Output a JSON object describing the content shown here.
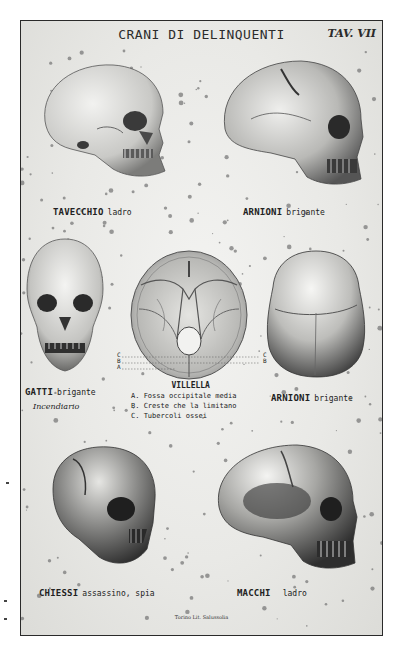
{
  "plate": {
    "title": "CRANI DI DELINQUENTI",
    "plate_number": "TAV. VII",
    "printer": "Torino Lit. Salussolia"
  },
  "figures": [
    {
      "id": "tavecchio",
      "name": "TAVECCHIO",
      "desc": "ladro",
      "view": "lateral-left"
    },
    {
      "id": "arnioni-lateral",
      "name": "ARNIONI",
      "desc": "brigante",
      "view": "lateral-right"
    },
    {
      "id": "gatti",
      "name": "GATTI",
      "desc": "brigante",
      "desc2": "Incendiario",
      "view": "frontal"
    },
    {
      "id": "villella",
      "name": "VILLELLA",
      "view": "cranial-base"
    },
    {
      "id": "arnioni-top",
      "name": "ARNIONI",
      "desc": "brigante",
      "view": "superior"
    },
    {
      "id": "chiessi",
      "name": "CHIESSI",
      "desc": "assassino, spia",
      "view": "three-quarter"
    },
    {
      "id": "macchi",
      "name": "MACCHI",
      "desc": "ladro",
      "view": "lateral-right"
    }
  ],
  "villella_legend": {
    "title": "VILLELLA",
    "items": [
      "A. Fossa occipitale media",
      "B. Creste che la limitano",
      "C. Tubercoli ossei"
    ],
    "markers": {
      "left": [
        "C",
        "B",
        "A"
      ],
      "right": [
        "C",
        "B"
      ]
    }
  },
  "colors": {
    "paper": "#ebebe8",
    "ink": "#222222",
    "bone_light": "#e2e2df",
    "bone_shadow": "#4a4a4a",
    "frame": "#2a2a2a"
  }
}
